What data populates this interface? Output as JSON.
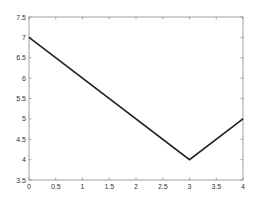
{
  "chart_data": {
    "type": "line",
    "title": "",
    "xlabel": "",
    "ylabel": "",
    "xlim": [
      0,
      4
    ],
    "ylim": [
      3.5,
      7.5
    ],
    "grid": false,
    "legend": null,
    "x_ticks": [
      "0",
      "0.5",
      "1",
      "1.5",
      "2",
      "2.5",
      "3",
      "3.5",
      "4"
    ],
    "y_ticks": [
      "3.5",
      "4",
      "4.5",
      "5",
      "5.5",
      "6",
      "6.5",
      "7",
      "7.5"
    ],
    "series": [
      {
        "name": "line",
        "color": "#222222",
        "x": [
          0,
          3,
          4
        ],
        "y": [
          7,
          4,
          5
        ]
      }
    ]
  },
  "layout": {
    "plot_left": 29,
    "plot_right": 243,
    "plot_top": 17,
    "plot_bottom": 180,
    "axis_color": "#888888",
    "line_width": 1.6
  }
}
